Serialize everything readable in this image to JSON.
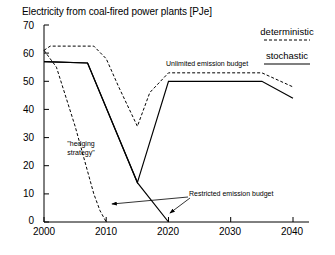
{
  "chart_data": {
    "type": "line",
    "title": "Electricity from coal-fired power plants [PJe]",
    "xlabel": "",
    "ylabel": "",
    "xlim": [
      2000,
      2040
    ],
    "ylim": [
      0,
      70
    ],
    "xticks": [
      "2000",
      "2010",
      "2020",
      "2030",
      "2040"
    ],
    "yticks": [
      "0",
      "10",
      "20",
      "30",
      "40",
      "50",
      "60",
      "70"
    ],
    "grid": false,
    "legend_position": "top-right",
    "legend": [
      {
        "name": "deterministic",
        "style": "dashed"
      },
      {
        "name": "stochastic",
        "style": "solid"
      }
    ],
    "annotations": [
      {
        "text": "Unlimited emission budget"
      },
      {
        "text": "Restricted emission budget"
      },
      {
        "text": "\"hedging",
        "text2": "strategy\""
      }
    ],
    "series": [
      {
        "name": "deterministic - unlimited emission budget",
        "style": "dashed",
        "x": [
          2000,
          2001,
          2008,
          2010,
          2012,
          2015,
          2017,
          2020,
          2035,
          2040
        ],
        "y": [
          61,
          62.5,
          62.5,
          58,
          48,
          34,
          46,
          53,
          53,
          48
        ]
      },
      {
        "name": "stochastic - unlimited emission budget",
        "style": "solid",
        "x": [
          2000,
          2007,
          2015,
          2020,
          2035,
          2040
        ],
        "y": [
          57,
          56.5,
          14,
          50,
          50,
          44
        ]
      },
      {
        "name": "deterministic - restricted emission budget",
        "style": "dashed",
        "x": [
          2000,
          2002,
          2005,
          2008,
          2009,
          2010
        ],
        "y": [
          61,
          55,
          34,
          10,
          4,
          0
        ]
      },
      {
        "name": "stochastic - restricted emission budget",
        "style": "solid",
        "x": [
          2000,
          2007,
          2015,
          2020
        ],
        "y": [
          57,
          56.5,
          14,
          0
        ]
      }
    ]
  },
  "axis": {
    "y_labels": [
      "70",
      "60",
      "50",
      "40",
      "30",
      "20",
      "10",
      "0"
    ],
    "x_labels": [
      "2000",
      "2010",
      "2020",
      "2030",
      "2040"
    ]
  },
  "legend": {
    "deterministic": "deterministic",
    "stochastic": "stochastic"
  },
  "annotations": {
    "unlimited": "Unlimited emission budget",
    "restricted": "Restricted emission budget",
    "hedging_line1": "\"hedging",
    "hedging_line2": "strategy\""
  },
  "title": "Electricity from coal-fired power plants [PJe]"
}
